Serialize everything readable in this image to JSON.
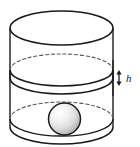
{
  "figure": {
    "name": "cylinder-with-sphere",
    "kind": "geometry-diagram",
    "width": 140,
    "height": 147,
    "background_color": "#ffffff",
    "stroke_color": "#1a1a1a",
    "dash_color": "#555555",
    "labels": {
      "height_label": "h"
    },
    "parts": {
      "cylinder": {
        "name": "cylinder-body",
        "left_x": 10,
        "right_x": 113,
        "top_center_y": 28,
        "bottom_center_y": 127,
        "rx": 51.5,
        "ry": 17
      },
      "top_ellipse": {
        "name": "cylinder-top-rim",
        "cx": 61.5,
        "cy": 28,
        "rx": 51.5,
        "ry": 17,
        "style": "solid"
      },
      "level_disc_top": {
        "name": "liquid-level-upper-ellipse",
        "cx": 61.5,
        "cy": 70,
        "rx": 51.5,
        "ry": 16,
        "back_style": "dashed",
        "front_style": "solid"
      },
      "level_disc_bottom": {
        "name": "liquid-level-lower-arc",
        "cx": 61.5,
        "cy": 78,
        "rx": 51.5,
        "ry": 16,
        "front_style": "solid"
      },
      "bottom_ellipse": {
        "name": "cylinder-bottom-rim",
        "cx": 61.5,
        "cy": 119,
        "rx": 51.5,
        "ry": 17,
        "back_style": "dashed",
        "front_style": "solid"
      },
      "sphere": {
        "name": "sphere",
        "cx": 64.5,
        "cy": 119,
        "r": 16,
        "fill_light": "#fbfbfb",
        "fill_mid": "#e2e2e2",
        "fill_dark": "#b8b8b8",
        "highlight_offset": "30% 28%"
      },
      "height_arrow": {
        "name": "height-dimension-arrow",
        "x": 119,
        "top_y": 71,
        "bottom_y": 85,
        "label": "h",
        "label_x": 127,
        "label_y": 80,
        "double_headed": true
      },
      "tick_line": {
        "name": "dimension-reference-line",
        "x": 113,
        "top_y": 62,
        "bottom_y": 94
      }
    }
  }
}
